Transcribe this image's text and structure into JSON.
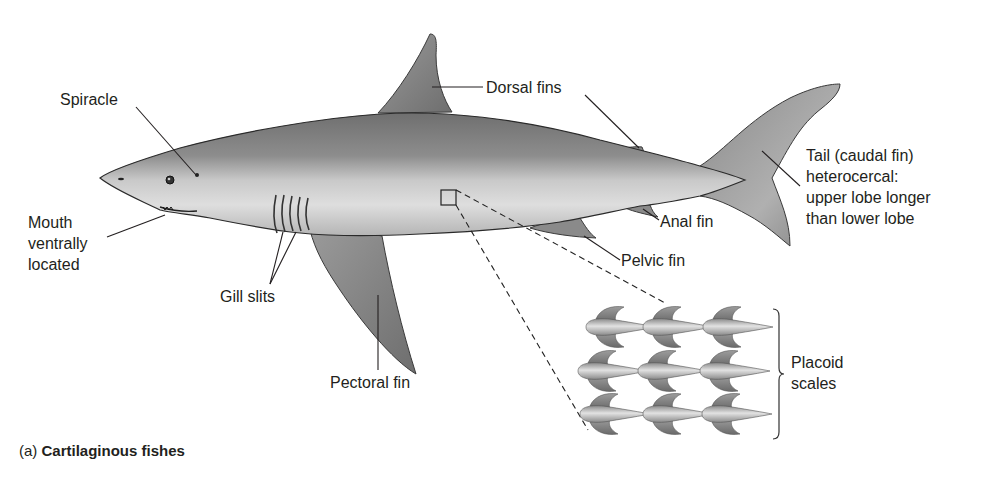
{
  "figure": {
    "caption_prefix": "(a)",
    "caption_title": "Cartilaginous fishes"
  },
  "labels": {
    "spiracle": "Spiracle",
    "dorsal_fins": "Dorsal fins",
    "mouth_line1": "Mouth",
    "mouth_line2": "ventrally",
    "mouth_line3": "located",
    "tail_line1": "Tail (caudal fin)",
    "tail_line2": "heterocercal:",
    "tail_line3": "upper lobe longer",
    "tail_line4": "than lower lobe",
    "anal_fin": "Anal fin",
    "pelvic_fin": "Pelvic fin",
    "gill_slits": "Gill slits",
    "pectoral_fin": "Pectoral fin",
    "placoid_line1": "Placoid",
    "placoid_line2": "scales"
  },
  "colors": {
    "background": "#ffffff",
    "body_dark": "#7a7a7a",
    "body_light": "#d9d9d9",
    "fin": "#8c8c8c",
    "line": "#231f20"
  }
}
